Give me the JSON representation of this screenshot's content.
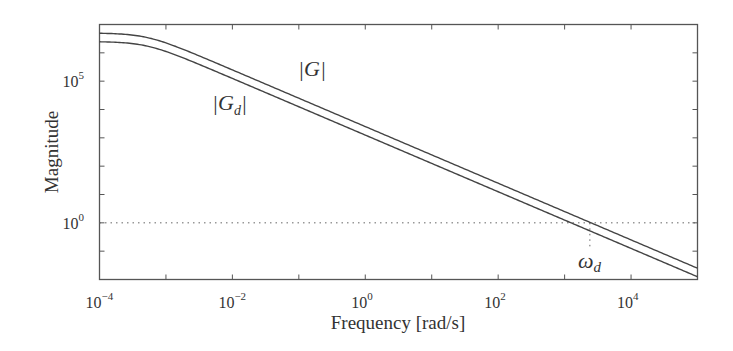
{
  "chart_data": {
    "type": "line",
    "title": "",
    "xlabel": "Frequency [rad/s]",
    "ylabel": "Magnitude",
    "xscale": "log",
    "yscale": "log",
    "xlim": [
      0.0001,
      100000
    ],
    "ylim": [
      0.01,
      10000000
    ],
    "grid": false,
    "x_ticks": [
      {
        "base": "10",
        "exp": "−4",
        "value": 0.0001
      },
      {
        "base": "10",
        "exp": "−2",
        "value": 0.01
      },
      {
        "base": "10",
        "exp": "0",
        "value": 1
      },
      {
        "base": "10",
        "exp": "2",
        "value": 100
      },
      {
        "base": "10",
        "exp": "4",
        "value": 10000
      }
    ],
    "y_ticks": [
      {
        "base": "10",
        "exp": "0",
        "value": 1
      },
      {
        "base": "10",
        "exp": "5",
        "value": 100000
      }
    ],
    "series": [
      {
        "name": "|G|",
        "label_text": "|G|",
        "dc_gain": 5000000,
        "corner_frequency": 0.0005,
        "slope_per_decade": -1,
        "points": [
          [
            0.0001,
            5000000
          ],
          [
            0.001,
            2300000
          ],
          [
            0.01,
            250000
          ],
          [
            1,
            2500
          ],
          [
            100,
            25
          ],
          [
            3700,
            1
          ],
          [
            100000,
            0.037
          ]
        ]
      },
      {
        "name": "|Gd|",
        "label_text": "|G",
        "label_sub": "d",
        "dc_gain": 2500000,
        "corner_frequency": 0.0005,
        "slope_per_decade": -1,
        "points": [
          [
            0.0001,
            2500000
          ],
          [
            0.001,
            1150000
          ],
          [
            0.01,
            125000
          ],
          [
            1,
            1250
          ],
          [
            100,
            12.5
          ],
          [
            2400,
            1
          ],
          [
            100000,
            0.018
          ]
        ]
      }
    ],
    "annotations": [
      {
        "type": "hline",
        "y": 1,
        "style": "dotted"
      },
      {
        "type": "vline",
        "x": 2400,
        "from_y": 1,
        "style": "dotted",
        "label": "ω",
        "label_sub": "d"
      }
    ]
  },
  "labels": {
    "xlabel": "Frequency [rad/s]",
    "ylabel": "Magnitude",
    "g_label": "|G|",
    "gd_label_main": "|G",
    "gd_label_sub": "d",
    "gd_label_close": "|",
    "omega": "ω",
    "omega_sub": "d"
  }
}
